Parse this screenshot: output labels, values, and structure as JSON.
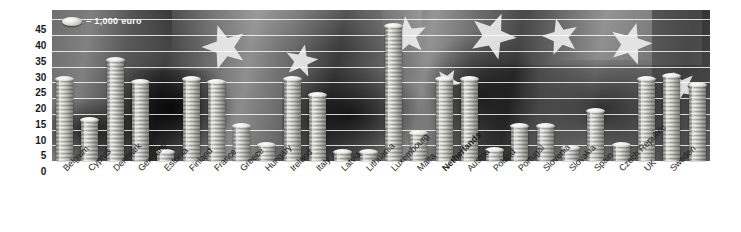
{
  "legend": {
    "icon": "coin-icon",
    "text": "= 1,000 euro"
  },
  "chart_data": {
    "type": "bar",
    "title": "",
    "subtitle": "",
    "xlabel": "",
    "ylabel": "",
    "ylim": [
      0,
      47
    ],
    "yticks": [
      0,
      5,
      10,
      15,
      20,
      25,
      30,
      35,
      40,
      45
    ],
    "ytick_labels": [
      "0",
      "5",
      "10",
      "15",
      "20",
      "25",
      "30",
      "35",
      "40",
      "45"
    ],
    "grid": true,
    "legend_position": "top-left",
    "unit_note": "= 1,000 euro",
    "bar_style": "stacked-coins",
    "categories": [
      "Belgium",
      "Cyprus",
      "Denmark",
      "Germany",
      "Estonia",
      "Finland",
      "France",
      "Greece",
      "Hungary",
      "Ireland",
      "Italy",
      "Latvia",
      "Lithuania",
      "Luxembourg",
      "Malta",
      "Netherlands",
      "Austria",
      "Poland",
      "Portugal",
      "Slovenia",
      "Slovakia",
      "Spain",
      "Czech Republic",
      "UK",
      "Sweden"
    ],
    "values": [
      26,
      13,
      32,
      25,
      3,
      26,
      25,
      11,
      5,
      26,
      21,
      3,
      3,
      43,
      9,
      26,
      26,
      3.5,
      11,
      11,
      4,
      16,
      5,
      26,
      27
    ],
    "highlighted_category": "Netherlands"
  },
  "stars": [
    {
      "name": "eu-star-1",
      "x": 150,
      "y": 14,
      "size": 46,
      "rotate": -18
    },
    {
      "name": "eu-star-2",
      "x": 232,
      "y": 34,
      "size": 34,
      "rotate": 12
    },
    {
      "name": "eu-star-3",
      "x": 336,
      "y": 6,
      "size": 40,
      "rotate": -8
    },
    {
      "name": "eu-star-4",
      "x": 416,
      "y": 2,
      "size": 48,
      "rotate": 22
    },
    {
      "name": "eu-star-5",
      "x": 490,
      "y": 8,
      "size": 38,
      "rotate": -14
    },
    {
      "name": "eu-star-6",
      "x": 556,
      "y": 12,
      "size": 44,
      "rotate": 16
    },
    {
      "name": "eu-star-7",
      "x": 612,
      "y": 60,
      "size": 34,
      "rotate": -25
    },
    {
      "name": "eu-star-8",
      "x": 382,
      "y": 58,
      "size": 26,
      "rotate": 30
    }
  ]
}
